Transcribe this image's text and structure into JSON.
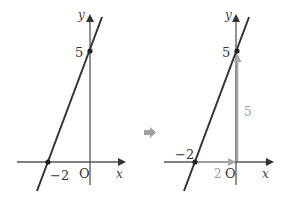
{
  "left_graph": {
    "y_axis_label": "y",
    "x_axis_label": "x",
    "origin_label": "O",
    "y_intercept_label": "5",
    "x_intercept_label": "−2"
  },
  "transition_arrow": {
    "icon": "right-arrow-icon",
    "color": "#a0a0a0"
  },
  "right_graph": {
    "y_axis_label": "y",
    "x_axis_label": "x",
    "origin_label": "O",
    "y_intercept_label": "5",
    "x_intercept_label": "−2",
    "horizontal_distance_label": "2",
    "vertical_distance_label": "5",
    "helper_arrow_color": "#a8a8a8"
  },
  "colors": {
    "line": "#333333",
    "axis": "#555555",
    "helper": "#a8a8a8"
  }
}
